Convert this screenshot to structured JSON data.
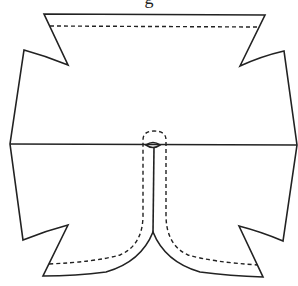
{
  "caption_fragment": "g",
  "diagram": {
    "type": "sewing-pattern",
    "colors": {
      "line": "#222222",
      "background": "#ffffff"
    },
    "elements": [
      {
        "name": "outline",
        "style": "solid"
      },
      {
        "name": "fold-line",
        "style": "solid"
      },
      {
        "name": "top-hem-stitching",
        "style": "dashed"
      },
      {
        "name": "center-opening-slit",
        "style": "solid"
      },
      {
        "name": "facing-stitching",
        "style": "dashed"
      }
    ]
  }
}
